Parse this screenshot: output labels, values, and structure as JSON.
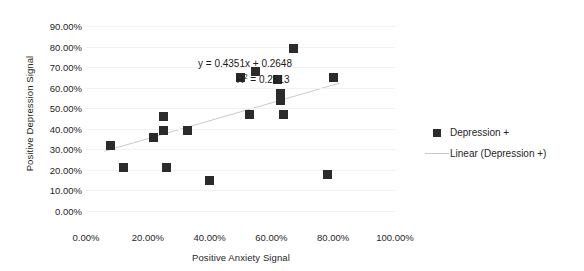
{
  "chart_data": {
    "type": "scatter",
    "title": "",
    "xlabel": "Positive Anxiety Signal",
    "ylabel": "Positive Depression Signal",
    "xlim": [
      0,
      100
    ],
    "ylim": [
      0,
      90
    ],
    "x_tick_labels": [
      "0.00%",
      "20.00%",
      "40.00%",
      "60.00%",
      "80.00%",
      "100.00%"
    ],
    "x_ticks": [
      0,
      20,
      40,
      60,
      80,
      100
    ],
    "y_tick_labels": [
      "0.00%",
      "10.00%",
      "20.00%",
      "30.00%",
      "40.00%",
      "50.00%",
      "60.00%",
      "70.00%",
      "80.00%",
      "90.00%"
    ],
    "y_ticks": [
      0,
      10,
      20,
      30,
      40,
      50,
      60,
      70,
      80,
      90
    ],
    "grid": "horizontal",
    "legend_position": "right",
    "series": [
      {
        "name": "Depression +",
        "type": "scatter",
        "marker": "square",
        "color": "#2b2b2b",
        "points": [
          [
            8,
            32
          ],
          [
            12,
            21
          ],
          [
            22,
            36
          ],
          [
            25,
            46
          ],
          [
            25,
            39
          ],
          [
            26,
            21
          ],
          [
            33,
            39
          ],
          [
            40,
            15
          ],
          [
            50,
            65
          ],
          [
            53,
            47
          ],
          [
            55,
            68
          ],
          [
            62,
            64
          ],
          [
            63,
            57
          ],
          [
            63,
            54
          ],
          [
            64,
            47
          ],
          [
            67,
            79
          ],
          [
            78,
            18
          ],
          [
            80,
            65
          ]
        ]
      },
      {
        "name": "Linear (Depression +)",
        "type": "line",
        "color": "#c9c9c9",
        "fit": {
          "slope": 0.4351,
          "intercept": 0.2648,
          "r_squared": 0.2613,
          "x_start": 6,
          "x_end": 82
        }
      }
    ],
    "annotations": {
      "equation": "y = 0.4351x + 0.2648",
      "r_squared": "R² = 0.2613"
    }
  },
  "legend": {
    "items": [
      {
        "label": "Depression +",
        "key": "square-marker"
      },
      {
        "label": "Linear (Depression +)",
        "key": "line-marker"
      }
    ]
  }
}
